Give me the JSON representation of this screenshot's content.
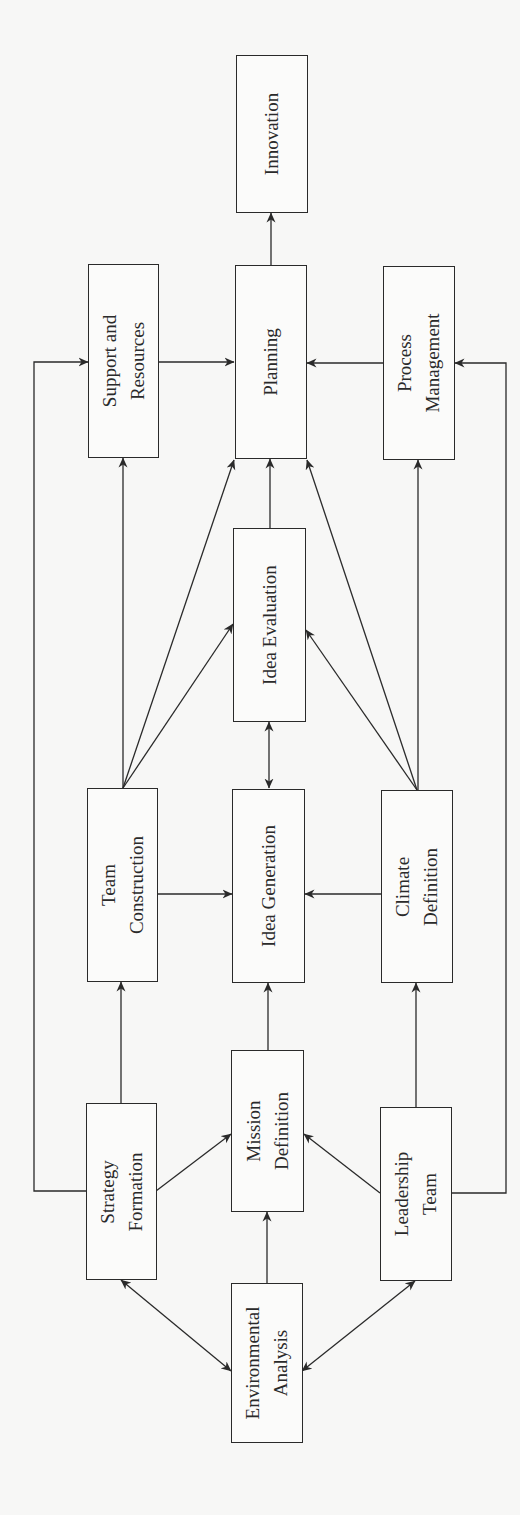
{
  "diagram": {
    "type": "flowchart",
    "orientation": "rotated-90-ccw",
    "colors": {
      "background": "#f7f7f6",
      "stroke": "#2a2a2a",
      "text": "#2a2a2a"
    },
    "nodes": {
      "innovation": {
        "lines": [
          "Innovation"
        ]
      },
      "support": {
        "lines": [
          "Support and",
          "Resources"
        ]
      },
      "planning": {
        "lines": [
          "Planning"
        ]
      },
      "process": {
        "lines": [
          "Process",
          "Management"
        ]
      },
      "idea_eval": {
        "lines": [
          "Idea Evaluation"
        ]
      },
      "team": {
        "lines": [
          "Team",
          "Construction"
        ]
      },
      "idea_gen": {
        "lines": [
          "Idea Generation"
        ]
      },
      "climate": {
        "lines": [
          "Climate",
          "Definition"
        ]
      },
      "strategy": {
        "lines": [
          "Strategy",
          "Formation"
        ]
      },
      "mission": {
        "lines": [
          "Mission",
          "Definition"
        ]
      },
      "leadership": {
        "lines": [
          "Leadership",
          "Team"
        ]
      },
      "environment": {
        "lines": [
          "Environmental",
          "Analysis"
        ]
      }
    },
    "edges": [
      {
        "from": "Planning",
        "to": "Innovation",
        "type": "arrow"
      },
      {
        "from": "Support and Resources",
        "to": "Planning",
        "type": "arrow"
      },
      {
        "from": "Process Management",
        "to": "Planning",
        "type": "arrow"
      },
      {
        "from": "Idea Evaluation",
        "to": "Planning",
        "type": "arrow"
      },
      {
        "from": "Team Construction",
        "to": "Planning",
        "type": "arrow"
      },
      {
        "from": "Climate Definition",
        "to": "Planning",
        "type": "arrow"
      },
      {
        "from": "Team Construction",
        "to": "Support and Resources",
        "type": "arrow"
      },
      {
        "from": "Climate Definition",
        "to": "Process Management",
        "type": "arrow"
      },
      {
        "from": "Team Construction",
        "to": "Idea Evaluation",
        "type": "arrow"
      },
      {
        "from": "Climate Definition",
        "to": "Idea Evaluation",
        "type": "arrow"
      },
      {
        "from": "Idea Generation",
        "to": "Idea Evaluation",
        "type": "bidirectional"
      },
      {
        "from": "Team Construction",
        "to": "Idea Generation",
        "type": "arrow"
      },
      {
        "from": "Climate Definition",
        "to": "Idea Generation",
        "type": "arrow"
      },
      {
        "from": "Mission Definition",
        "to": "Idea Generation",
        "type": "arrow"
      },
      {
        "from": "Strategy Formation",
        "to": "Team Construction",
        "type": "arrow"
      },
      {
        "from": "Leadership Team",
        "to": "Climate Definition",
        "type": "arrow"
      },
      {
        "from": "Strategy Formation",
        "to": "Mission Definition",
        "type": "arrow"
      },
      {
        "from": "Leadership Team",
        "to": "Mission Definition",
        "type": "arrow"
      },
      {
        "from": "Environmental Analysis",
        "to": "Mission Definition",
        "type": "arrow"
      },
      {
        "from": "Strategy Formation",
        "to": "Support and Resources",
        "type": "arrow",
        "routing": "outer-left"
      },
      {
        "from": "Leadership Team",
        "to": "Process Management",
        "type": "arrow",
        "routing": "outer-right"
      },
      {
        "from": "Environmental Analysis",
        "to": "Strategy Formation",
        "type": "bidirectional"
      },
      {
        "from": "Environmental Analysis",
        "to": "Leadership Team",
        "type": "bidirectional"
      }
    ]
  }
}
